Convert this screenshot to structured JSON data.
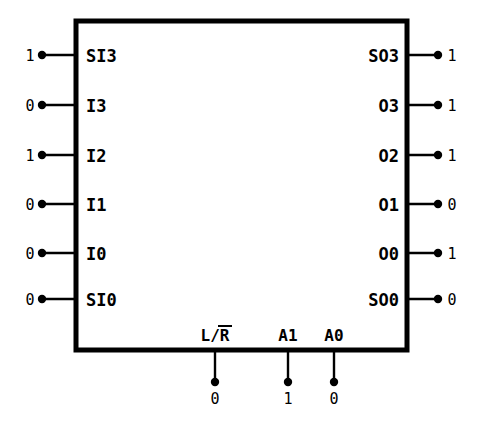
{
  "diagram": {
    "box": {
      "x": 76,
      "y": 21,
      "width": 331,
      "height": 329
    },
    "geometry": {
      "left_value_x": 30,
      "left_dot_x": 42,
      "left_label_x": 86,
      "right_label_anchor_x": 399,
      "right_dot_x": 438,
      "right_value_x": 452,
      "bottom_box_y": 350,
      "bottom_dot_y": 382,
      "bottom_value_y": 404,
      "bottom_label_y": 341
    },
    "inputs": [
      {
        "name": "SI3",
        "label": "SI3",
        "value": "1",
        "y": 55
      },
      {
        "name": "I3",
        "label": "I3",
        "value": "0",
        "y": 105
      },
      {
        "name": "I2",
        "label": "I2",
        "value": "1",
        "y": 155
      },
      {
        "name": "I1",
        "label": "I1",
        "value": "0",
        "y": 204
      },
      {
        "name": "I0",
        "label": "I0",
        "value": "0",
        "y": 253
      },
      {
        "name": "SI0",
        "label": "SI0",
        "value": "0",
        "y": 299
      }
    ],
    "outputs": [
      {
        "name": "SO3",
        "label": "SO3",
        "value": "1",
        "y": 55
      },
      {
        "name": "O3",
        "label": "O3",
        "value": "1",
        "y": 105
      },
      {
        "name": "O2",
        "label": "O2",
        "value": "1",
        "y": 155
      },
      {
        "name": "O1",
        "label": "O1",
        "value": "0",
        "y": 204
      },
      {
        "name": "O0",
        "label": "O0",
        "value": "1",
        "y": 253
      },
      {
        "name": "SO0",
        "label": "SO0",
        "value": "0",
        "y": 299
      }
    ],
    "controls": [
      {
        "name": "L/R",
        "label": "L/",
        "overbar_label": "R",
        "has_overbar": true,
        "value": "0",
        "x": 215
      },
      {
        "name": "A1",
        "label": "A1",
        "overbar_label": "",
        "has_overbar": false,
        "value": "1",
        "x": 288
      },
      {
        "name": "A0",
        "label": "A0",
        "overbar_label": "",
        "has_overbar": false,
        "value": "0",
        "x": 334
      }
    ],
    "internal_routes": [
      {
        "name": "route-si3-to-so3-o3-o2",
        "from": "SI3",
        "to": [
          "SO3",
          "O3",
          "O2"
        ],
        "path": "M 132 55 L 310 55 L 310 155 M 310 105 L 380 105 M 310 155 L 380 155 M 310 55 L 380 55"
      },
      {
        "name": "route-i3-to-o1",
        "from": "I3",
        "to": [
          "O1"
        ],
        "path": "M 118 105 L 272 105 L 272 204 L 380 204"
      },
      {
        "name": "route-i2-to-o0",
        "from": "I2",
        "to": [
          "O0"
        ],
        "path": "M 118 155 L 217 155 L 217 253 L 380 253"
      },
      {
        "name": "route-i1-to-so0",
        "from": "I1",
        "to": [
          "SO0"
        ],
        "path": "M 118 204 L 172 204 L 172 299 L 380 299"
      }
    ],
    "unconnected_inputs": [
      "I0"
    ],
    "colors": {
      "line": "#000000",
      "background": "#ffffff",
      "box_fill": "#ffffff"
    }
  }
}
